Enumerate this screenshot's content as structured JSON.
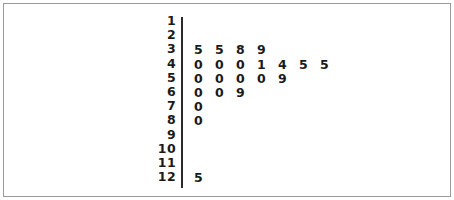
{
  "figure": {
    "kind": "stem-and-leaf-plot",
    "border_color": "#9a9a9a",
    "divider_color": "#2a2a2a",
    "text_color": "#1a1a1a",
    "background": "#ffffff"
  },
  "chart_data": {
    "type": "table",
    "title": "",
    "subtitle": "",
    "xlabel": "",
    "ylabel": "",
    "plot_kind": "stem-and-leaf",
    "stem_label": "",
    "leaf_label": "",
    "stems": [
      1,
      2,
      3,
      4,
      5,
      6,
      7,
      8,
      9,
      10,
      11,
      12
    ],
    "rows": [
      {
        "stem": "1",
        "leaves": []
      },
      {
        "stem": "2",
        "leaves": []
      },
      {
        "stem": "3",
        "leaves": [
          "5",
          "5",
          "8",
          "9"
        ]
      },
      {
        "stem": "4",
        "leaves": [
          "0",
          "0",
          "0",
          "1",
          "4",
          "5",
          "5"
        ]
      },
      {
        "stem": "5",
        "leaves": [
          "0",
          "0",
          "0",
          "0",
          "9"
        ]
      },
      {
        "stem": "6",
        "leaves": [
          "0",
          "0",
          "9"
        ]
      },
      {
        "stem": "7",
        "leaves": [
          "0"
        ]
      },
      {
        "stem": "8",
        "leaves": [
          "0"
        ]
      },
      {
        "stem": "9",
        "leaves": []
      },
      {
        "stem": "10",
        "leaves": []
      },
      {
        "stem": "11",
        "leaves": []
      },
      {
        "stem": "12",
        "leaves": [
          "5"
        ]
      }
    ],
    "values": [
      35,
      35,
      38,
      39,
      40,
      40,
      40,
      41,
      44,
      45,
      45,
      50,
      50,
      50,
      50,
      59,
      60,
      60,
      69,
      70,
      80,
      125
    ],
    "counts": [
      0,
      0,
      4,
      7,
      5,
      3,
      1,
      1,
      0,
      0,
      0,
      1
    ],
    "grid": false,
    "legend": null
  }
}
